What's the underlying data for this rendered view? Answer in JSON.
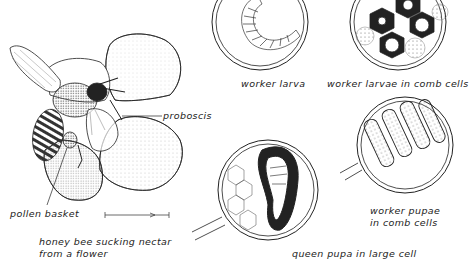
{
  "figure": {
    "labels": {
      "proboscis": "proboscis",
      "pollen_basket": "pollen basket",
      "caption_line1": "honey bee sucking nectar",
      "caption_line2": "from a flower",
      "worker_larva": "worker larva",
      "worker_larvae_comb": "worker larvae in comb cells",
      "worker_pupae_line1": "worker pupae",
      "worker_pupae_line2": "in comb cells",
      "queen_pupa": "queen pupa in large cell"
    },
    "panels": [
      {
        "id": "bee-on-flower",
        "desc": "honey bee on flower"
      },
      {
        "id": "worker-larva",
        "desc": "magnifier circle with curled larva"
      },
      {
        "id": "worker-larvae-comb",
        "desc": "magnifier circle with larvae in hexagonal cells"
      },
      {
        "id": "worker-pupae-comb",
        "desc": "magnifier circle with pupae in cells"
      },
      {
        "id": "queen-pupa",
        "desc": "magnifier circle with queen pupa in large cell"
      }
    ],
    "colors": {
      "ink": "#222222",
      "paper": "#ffffff"
    }
  }
}
